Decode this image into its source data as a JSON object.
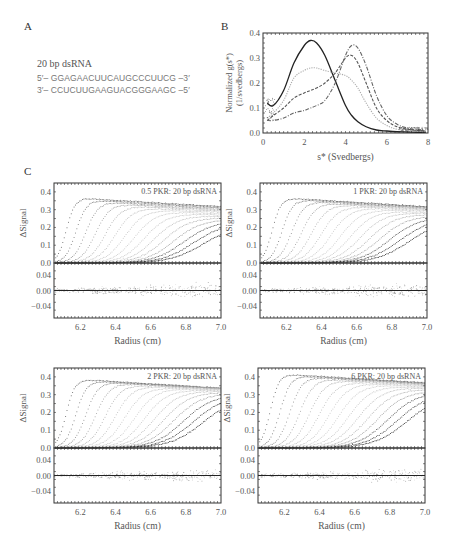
{
  "panels": {
    "a": {
      "letter": "A",
      "title": "20 bp dsRNA",
      "strand_top": "5′– GGAGAACUUCAUGCCCUUCG –3′",
      "strand_bottom": "3′– CCUCUUGAAGUACGGGAAGC –5′"
    },
    "b": {
      "letter": "B"
    },
    "c": {
      "letter": "C"
    }
  },
  "chart_data": [
    {
      "id": "B",
      "type": "line",
      "title": "",
      "xlabel": "s* (Svedbergs)",
      "ylabel": "Normalized g(s*) (1/svedbergs)",
      "xlim": [
        0,
        8
      ],
      "ylim": [
        0,
        0.4
      ],
      "xticks": [
        "0",
        "2",
        "4",
        "6",
        "8"
      ],
      "yticks": [
        "0.0",
        "0.1",
        "0.2",
        "0.3",
        "0.4"
      ],
      "grid": false,
      "legend": null,
      "x": [
        0.2,
        0.5,
        1.0,
        1.5,
        2.0,
        2.3,
        2.6,
        3.0,
        3.5,
        4.0,
        4.3,
        4.6,
        5.0,
        5.5,
        6.0,
        6.5,
        7.0,
        7.5,
        7.9
      ],
      "series": [
        {
          "name": "20 bp dsRNA alone (solid black)",
          "style": "solid",
          "color": "#222222",
          "values": [
            0.12,
            0.11,
            0.17,
            0.28,
            0.35,
            0.37,
            0.36,
            0.31,
            0.21,
            0.11,
            0.07,
            0.045,
            0.025,
            0.012,
            0.008,
            0.005,
            0.004,
            0.003,
            0.003
          ]
        },
        {
          "name": "0.5 PKR : 20 bp dsRNA (light gray)",
          "style": "dotted",
          "color": "#aaaaaa",
          "values": [
            0.06,
            0.08,
            0.13,
            0.22,
            0.25,
            0.26,
            0.26,
            0.25,
            0.24,
            0.23,
            0.21,
            0.18,
            0.12,
            0.06,
            0.03,
            0.015,
            0.01,
            0.007,
            0.005
          ]
        },
        {
          "name": "1 PKR : 20 bp dsRNA (dark dashed)",
          "style": "dashed",
          "color": "#555555",
          "values": [
            0.05,
            0.07,
            0.1,
            0.14,
            0.16,
            0.17,
            0.18,
            0.2,
            0.24,
            0.3,
            0.31,
            0.28,
            0.2,
            0.1,
            0.05,
            0.025,
            0.015,
            0.01,
            0.008
          ]
        },
        {
          "name": "2 PKR : 20 bp dsRNA (dash-dot)",
          "style": "dashdot",
          "color": "#666666",
          "values": [
            0.05,
            0.05,
            0.06,
            0.08,
            0.09,
            0.1,
            0.11,
            0.13,
            0.2,
            0.31,
            0.35,
            0.34,
            0.27,
            0.15,
            0.07,
            0.035,
            0.02,
            0.012,
            0.01
          ]
        }
      ]
    },
    {
      "id": "C1",
      "type": "scatter",
      "annotation": "0.5 PKR: 20 bp dsRNA",
      "xlabel": "Radius (cm)",
      "ylabel": "ΔSignal",
      "xlim": [
        6.05,
        7.0
      ],
      "ylim": [
        0,
        0.45
      ],
      "xticks": [
        "6.2",
        "6.4",
        "6.6",
        "6.8",
        "7.0"
      ],
      "yticks": [
        "0.0",
        "0.1",
        "0.2",
        "0.3",
        "0.4"
      ],
      "residual_ylim": [
        -0.07,
        0.07
      ],
      "residual_yticks": [
        "0.04",
        "0.00",
        "−0.04"
      ],
      "peak_plateau": 0.37,
      "final_scan_plateau": 0.2,
      "boundary_count": 15
    },
    {
      "id": "C2",
      "type": "scatter",
      "annotation": "1 PKR: 20 bp dsRNA",
      "xlabel": "Radius (cm)",
      "ylabel": "ΔSignal",
      "xlim": [
        6.05,
        7.0
      ],
      "ylim": [
        0,
        0.45
      ],
      "xticks": [
        "6.2",
        "6.4",
        "6.6",
        "6.8",
        "7.0"
      ],
      "yticks": [
        "0.0",
        "0.1",
        "0.2",
        "0.3",
        "0.4"
      ],
      "residual_ylim": [
        -0.07,
        0.07
      ],
      "residual_yticks": [
        "0.04",
        "0.00",
        "−0.04"
      ],
      "peak_plateau": 0.37,
      "final_scan_plateau": 0.23,
      "boundary_count": 15
    },
    {
      "id": "C3",
      "type": "scatter",
      "annotation": "2 PKR: 20 bp dsRNA",
      "xlabel": "Radius (cm)",
      "ylabel": "ΔSignal",
      "xlim": [
        6.05,
        7.0
      ],
      "ylim": [
        0,
        0.45
      ],
      "xticks": [
        "6.2",
        "6.4",
        "6.6",
        "6.8",
        "7.0"
      ],
      "yticks": [
        "0.0",
        "0.1",
        "0.2",
        "0.3",
        "0.4"
      ],
      "residual_ylim": [
        -0.07,
        0.07
      ],
      "residual_yticks": [
        "0.04",
        "0.00",
        "−0.04"
      ],
      "peak_plateau": 0.39,
      "final_scan_plateau": 0.28,
      "boundary_count": 15
    },
    {
      "id": "C4",
      "type": "scatter",
      "annotation": "6 PKR: 20 bp dsRNA",
      "xlabel": "Radius (cm)",
      "ylabel": "ΔSignal",
      "xlim": [
        6.05,
        7.0
      ],
      "ylim": [
        0,
        0.45
      ],
      "xticks": [
        "6.2",
        "6.4",
        "6.6",
        "6.8",
        "7.0"
      ],
      "yticks": [
        "0.0",
        "0.1",
        "0.2",
        "0.3",
        "0.4"
      ],
      "residual_ylim": [
        -0.07,
        0.07
      ],
      "residual_yticks": [
        "0.04",
        "0.00",
        "−0.04"
      ],
      "peak_plateau": 0.42,
      "final_scan_plateau": 0.29,
      "boundary_count": 15
    }
  ]
}
